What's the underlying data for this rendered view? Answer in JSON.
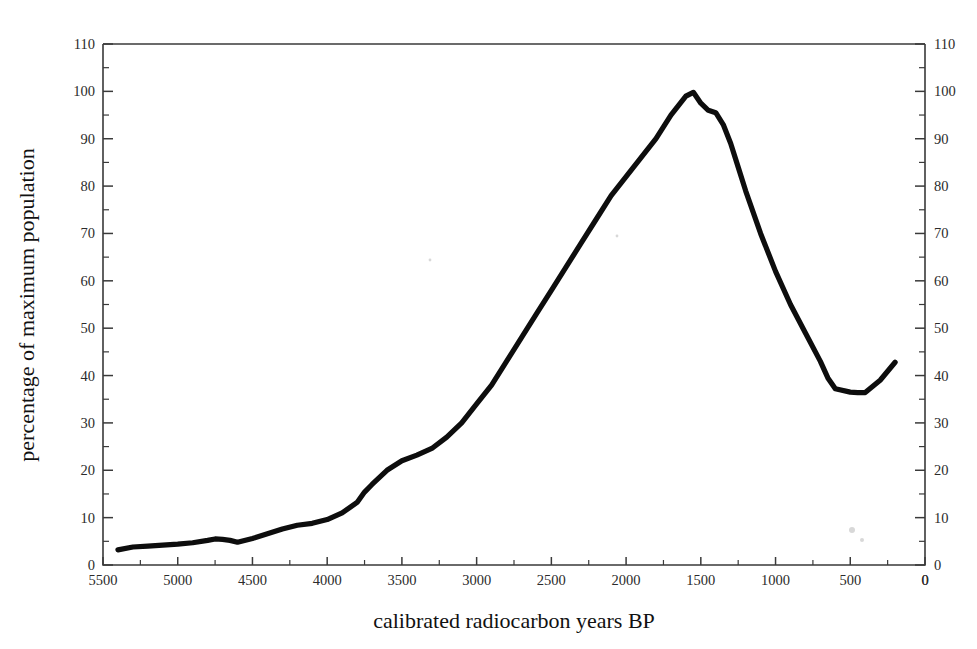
{
  "chart_data": {
    "type": "line",
    "title": "",
    "xlabel": "calibrated radiocarbon years BP",
    "ylabel": "percentage of maximum population",
    "ylabel_right": "percentage of maximum population",
    "xlim": [
      5500,
      0
    ],
    "ylim": [
      0,
      110
    ],
    "x_reversed": true,
    "grid": false,
    "legend": null,
    "x_major_step": 500,
    "x_minor_step": 250,
    "y_major_step": 10,
    "y_minor_step": 5,
    "x_tick_labels": [
      "5500",
      "5000",
      "4500",
      "4000",
      "3500",
      "3000",
      "2500",
      "2000",
      "1500",
      "1000",
      "500",
      "0"
    ],
    "y_tick_labels_left": [
      "0",
      "10",
      "20",
      "30",
      "40",
      "50",
      "60",
      "70",
      "80",
      "90",
      "100",
      "110"
    ],
    "y_tick_labels_right": [
      "0",
      "10",
      "20",
      "30",
      "40",
      "50",
      "60",
      "70",
      "80",
      "90",
      "100",
      "110"
    ],
    "series": [
      {
        "name": "population",
        "color": "#0d0d0d",
        "x": [
          5400,
          5300,
          5200,
          5100,
          5000,
          4900,
          4800,
          4750,
          4700,
          4650,
          4600,
          4500,
          4400,
          4300,
          4200,
          4100,
          4000,
          3900,
          3800,
          3750,
          3700,
          3600,
          3500,
          3400,
          3300,
          3200,
          3100,
          3000,
          2900,
          2800,
          2700,
          2600,
          2500,
          2400,
          2300,
          2200,
          2100,
          2000,
          1900,
          1800,
          1700,
          1600,
          1550,
          1500,
          1450,
          1400,
          1350,
          1300,
          1250,
          1200,
          1100,
          1000,
          900,
          800,
          700,
          650,
          600,
          500,
          450,
          400,
          300,
          200
        ],
        "y": [
          3.2,
          3.8,
          4.0,
          4.2,
          4.4,
          4.7,
          5.2,
          5.5,
          5.4,
          5.2,
          4.8,
          5.6,
          6.6,
          7.6,
          8.4,
          8.8,
          9.6,
          11.0,
          13.2,
          15.4,
          17.0,
          20.0,
          22.0,
          23.2,
          24.6,
          27.0,
          30.0,
          34.0,
          38.0,
          43.0,
          48.0,
          53.0,
          58.0,
          63.0,
          68.0,
          73.0,
          78.0,
          82.0,
          86.0,
          90.0,
          95.0,
          99.0,
          99.8,
          97.5,
          96.0,
          95.5,
          93.0,
          89.0,
          84.0,
          79.0,
          70.0,
          62.0,
          55.0,
          49.0,
          43.0,
          39.5,
          37.2,
          36.5,
          36.4,
          36.4,
          39.0,
          42.8
        ]
      }
    ]
  }
}
